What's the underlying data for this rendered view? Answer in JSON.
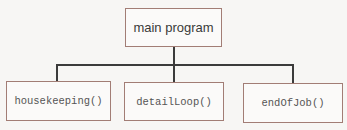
{
  "diagram": {
    "type": "hierarchy-chart",
    "root": {
      "label": "main program"
    },
    "children": [
      {
        "label": "housekeeping()"
      },
      {
        "label": "detailLoop()"
      },
      {
        "label": "endOfJob()"
      }
    ],
    "colors": {
      "box_border": "#a27d75",
      "connector": "#3b3b3b",
      "text_root": "#3a3a3a",
      "text_child": "#555555"
    }
  }
}
